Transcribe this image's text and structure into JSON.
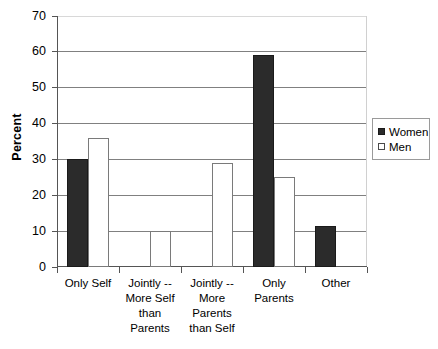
{
  "chart_data": {
    "type": "bar",
    "title": "",
    "xlabel": "",
    "ylabel": "Percent",
    "ylim": [
      0,
      70
    ],
    "ytick_step": 10,
    "yticks": [
      70,
      60,
      50,
      40,
      30,
      20,
      10,
      0
    ],
    "ytick_labels": [
      "70",
      "60",
      "50",
      "40",
      "30",
      "20",
      "10",
      "0"
    ],
    "grid": true,
    "grid_axis": "y",
    "legend_position": "right",
    "categories": [
      "Only Self",
      "Jointly --\nMore Self\nthan\nParents",
      "Jointly --\nMore\nParents\nthan Self",
      "Only\nParents",
      "Other"
    ],
    "category_lines": [
      [
        "Only Self"
      ],
      [
        "Jointly --",
        "More Self",
        "than",
        "Parents"
      ],
      [
        "Jointly --",
        "More",
        "Parents",
        "than Self"
      ],
      [
        "Only",
        "Parents"
      ],
      [
        "Other"
      ]
    ],
    "series": [
      {
        "name": "Women",
        "color": "#2b2b2b",
        "values": [
          30,
          0,
          0,
          59,
          11.5
        ]
      },
      {
        "name": "Men",
        "color": "#ffffff",
        "values": [
          36,
          10,
          29,
          25,
          0
        ]
      }
    ]
  },
  "legend": {
    "items": [
      {
        "label": "Women",
        "style": "filled"
      },
      {
        "label": "Men",
        "style": "open"
      }
    ]
  },
  "axis": {
    "y_title": "Percent"
  }
}
